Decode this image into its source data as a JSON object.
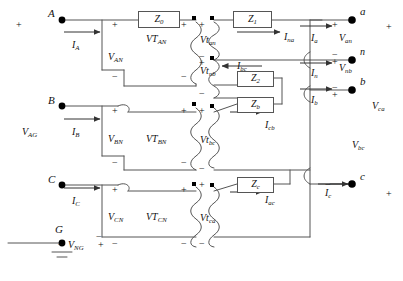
{
  "diagram": {
    "type": "electrical-schematic",
    "stroke_color": "#555555",
    "node_color": "#000000"
  },
  "primary_terminals": [
    {
      "name": "A",
      "current": "I",
      "current_sub": "A"
    },
    {
      "name": "B",
      "current": "I",
      "current_sub": "B"
    },
    {
      "name": "C",
      "current": "I",
      "current_sub": "C"
    },
    {
      "name": "G",
      "current": "",
      "current_sub": ""
    }
  ],
  "secondary_terminals": [
    {
      "name": "a"
    },
    {
      "name": "n"
    },
    {
      "name": "b"
    },
    {
      "name": "c"
    }
  ],
  "impedances": [
    {
      "label": "Z",
      "sub": "0",
      "x": 138,
      "y": 11,
      "w": 40,
      "h": 15
    },
    {
      "label": "Z",
      "sub": "1",
      "x": 233,
      "y": 11,
      "w": 37,
      "h": 15
    },
    {
      "label": "Z",
      "sub": "2",
      "x": 237,
      "y": 71,
      "w": 35,
      "h": 14
    },
    {
      "label": "Z",
      "sub": "b",
      "x": 237,
      "y": 97,
      "w": 35,
      "h": 14
    },
    {
      "label": "Z",
      "sub": "c",
      "x": 237,
      "y": 177,
      "w": 35,
      "h": 14
    }
  ],
  "primary_windings": [
    {
      "label": "VT",
      "sub": "AN",
      "x": 146,
      "y": 34
    },
    {
      "label": "VT",
      "sub": "BN",
      "x": 146,
      "y": 134
    },
    {
      "label": "VT",
      "sub": "CN",
      "x": 146,
      "y": 212
    }
  ],
  "secondary_windings": [
    {
      "label": "Vt",
      "sub": "an",
      "x": 200,
      "y": 35
    },
    {
      "label": "Vt",
      "sub": "nb",
      "x": 200,
      "y": 66
    },
    {
      "label": "Vt",
      "sub": "bc",
      "x": 200,
      "y": 135
    },
    {
      "label": "Vt",
      "sub": "ca",
      "x": 200,
      "y": 213
    }
  ],
  "phase_voltages": [
    {
      "label": "V",
      "sub": "AN",
      "x": 108,
      "y": 52
    },
    {
      "label": "V",
      "sub": "BN",
      "x": 108,
      "y": 134
    },
    {
      "label": "V",
      "sub": "CN",
      "x": 108,
      "y": 212
    }
  ],
  "source_voltages": [
    {
      "label": "V",
      "sub": "AG",
      "x": 22,
      "y": 127
    },
    {
      "label": "V",
      "sub": "NG",
      "x": 68,
      "y": 240
    }
  ],
  "output_voltages": [
    {
      "label": "V",
      "sub": "an",
      "x": 339,
      "y": 33
    },
    {
      "label": "V",
      "sub": "nb",
      "x": 339,
      "y": 63
    },
    {
      "label": "V",
      "sub": "bc",
      "x": 352,
      "y": 140
    },
    {
      "label": "V",
      "sub": "ca",
      "x": 372,
      "y": 101
    }
  ],
  "currents": [
    {
      "label": "I",
      "sub": "A",
      "x": 72,
      "y": 40
    },
    {
      "label": "I",
      "sub": "B",
      "x": 72,
      "y": 127
    },
    {
      "label": "I",
      "sub": "C",
      "x": 72,
      "y": 196
    },
    {
      "label": "I",
      "sub": "na",
      "x": 284,
      "y": 32
    },
    {
      "label": "I",
      "sub": "bc",
      "x": 237,
      "y": 61
    },
    {
      "label": "I",
      "sub": "cb",
      "x": 265,
      "y": 120
    },
    {
      "label": "I",
      "sub": "ac",
      "x": 265,
      "y": 195
    },
    {
      "label": "I",
      "sub": "a",
      "x": 311,
      "y": 33
    },
    {
      "label": "I",
      "sub": "n",
      "x": 311,
      "y": 68
    },
    {
      "label": "I",
      "sub": "b",
      "x": 311,
      "y": 95
    },
    {
      "label": "I",
      "sub": "c",
      "x": 325,
      "y": 188
    }
  ],
  "polarity_marks": [
    {
      "sign": "+",
      "x": 16,
      "y": 20
    },
    {
      "sign": "+",
      "x": 112,
      "y": 20
    },
    {
      "sign": "−",
      "x": 112,
      "y": 72
    },
    {
      "sign": "+",
      "x": 112,
      "y": 106
    },
    {
      "sign": "−",
      "x": 112,
      "y": 158
    },
    {
      "sign": "+",
      "x": 112,
      "y": 185
    },
    {
      "sign": "−",
      "x": 112,
      "y": 239
    },
    {
      "sign": "+",
      "x": 181,
      "y": 20
    },
    {
      "sign": "−",
      "x": 181,
      "y": 72
    },
    {
      "sign": "+",
      "x": 181,
      "y": 106
    },
    {
      "sign": "−",
      "x": 181,
      "y": 158
    },
    {
      "sign": "+",
      "x": 181,
      "y": 185
    },
    {
      "sign": "−",
      "x": 181,
      "y": 239
    },
    {
      "sign": "+",
      "x": 199,
      "y": 20
    },
    {
      "sign": "−",
      "x": 199,
      "y": 52
    },
    {
      "sign": "+",
      "x": 199,
      "y": 58
    },
    {
      "sign": "−",
      "x": 199,
      "y": 89
    },
    {
      "sign": "+",
      "x": 199,
      "y": 106
    },
    {
      "sign": "−",
      "x": 199,
      "y": 164
    },
    {
      "sign": "+",
      "x": 199,
      "y": 180
    },
    {
      "sign": "−",
      "x": 199,
      "y": 239
    },
    {
      "sign": "+",
      "x": 332,
      "y": 20
    },
    {
      "sign": "−",
      "x": 332,
      "y": 50
    },
    {
      "sign": "+",
      "x": 332,
      "y": 57
    },
    {
      "sign": "−",
      "x": 332,
      "y": 83
    },
    {
      "sign": "+",
      "x": 332,
      "y": 90
    },
    {
      "sign": "−",
      "x": 325,
      "y": 180
    },
    {
      "sign": "+",
      "x": 386,
      "y": 22
    },
    {
      "sign": "+",
      "x": 386,
      "y": 189
    },
    {
      "sign": "−",
      "x": 96,
      "y": 232
    },
    {
      "sign": "−",
      "x": 58,
      "y": 240
    },
    {
      "sign": "+",
      "x": 98,
      "y": 240
    }
  ]
}
